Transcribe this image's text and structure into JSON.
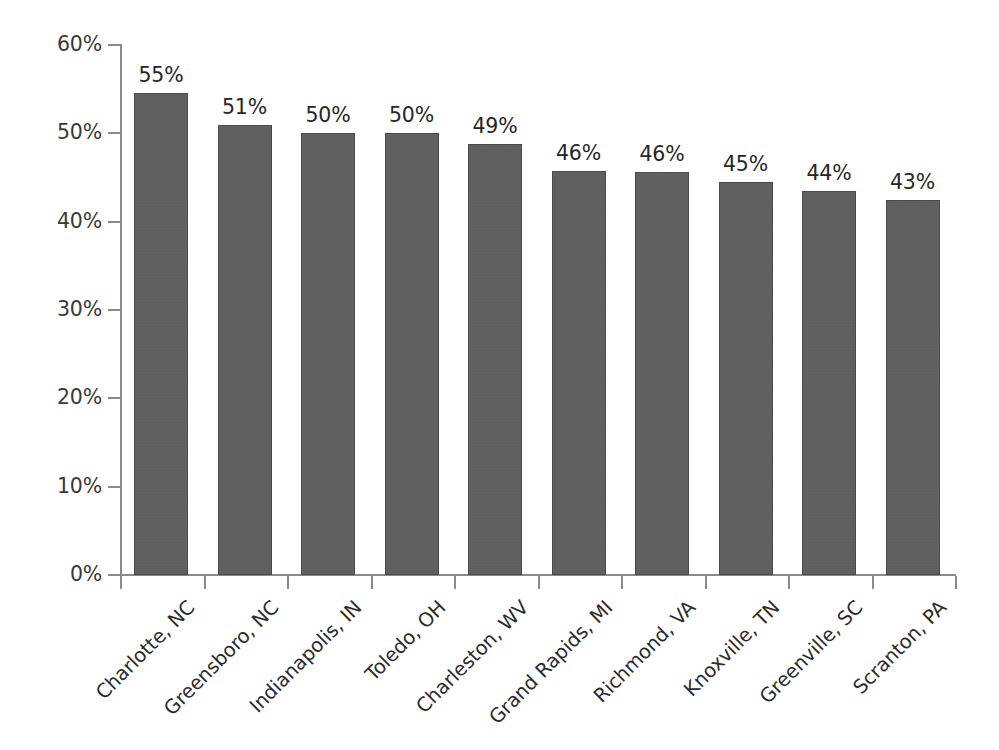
{
  "chart_data": {
    "type": "bar",
    "title": "",
    "subtitle": "",
    "xlabel": "",
    "ylabel": "",
    "ylim": [
      0,
      60
    ],
    "ytick_labels": [
      "0%",
      "10%",
      "20%",
      "30%",
      "40%",
      "50%",
      "60%"
    ],
    "ytick_values": [
      0,
      10,
      20,
      30,
      40,
      50,
      60
    ],
    "grid": false,
    "legend": null,
    "legend_position": "none",
    "categories": [
      "Charlotte, NC",
      "Greensboro, NC",
      "Indianapolis, IN",
      "Toledo, OH",
      "Charleston, WV",
      "Grand Rapids, MI",
      "Richmond, VA",
      "Knoxville, TN",
      "Greenville, SC",
      "Scranton, PA"
    ],
    "values": [
      54.6,
      51.0,
      50.0,
      50.0,
      48.8,
      45.7,
      45.6,
      44.5,
      43.5,
      42.5
    ],
    "data_labels": [
      "55%",
      "51%",
      "50%",
      "50%",
      "49%",
      "46%",
      "46%",
      "45%",
      "44%",
      "43%"
    ],
    "bar_color": "#5e5e5e",
    "bar_edge_color": "#4a4a4a",
    "axis_color": "#8a8a8a",
    "text_color": "#2b2b2b",
    "background_color": "#ffffff"
  }
}
